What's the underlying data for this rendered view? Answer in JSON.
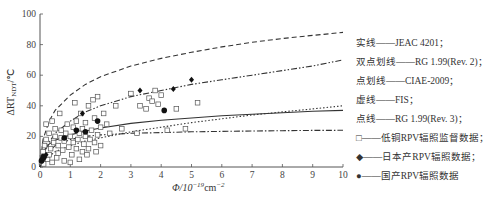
{
  "chart_data": {
    "type": "scatter",
    "title": "",
    "xlabel": "Φ/10⁻¹⁹cm⁻²",
    "ylabel": "ΔRT_NDT/℃",
    "xlim": [
      0,
      10
    ],
    "ylim": [
      0,
      100
    ],
    "x_ticks": [
      "0",
      "1",
      "2",
      "3",
      "4",
      "5",
      "6",
      "7",
      "8",
      "9",
      "10"
    ],
    "y_ticks": [
      "0",
      "20",
      "40",
      "60",
      "80",
      "100"
    ],
    "grid": false,
    "legend_position": "right",
    "curves": [
      {
        "name": "JEAC 4201",
        "style": "solid",
        "label": "实线——JEAC 4201；",
        "x": [
          0,
          0.1,
          0.3,
          0.5,
          1,
          1.5,
          2,
          3,
          4,
          5,
          6,
          7,
          8,
          9,
          10
        ],
        "y": [
          0,
          10,
          15,
          17.5,
          21,
          23.5,
          25.5,
          28.5,
          30.5,
          32,
          33.5,
          34.5,
          35.5,
          36.5,
          37
        ]
      },
      {
        "name": "RG 1.99(Rev. 2)",
        "style": "dash-dot-dot",
        "label": "双点划线——RG 1.99(Rev. 2)；",
        "x": [
          0,
          0.1,
          0.3,
          0.5,
          1,
          1.5,
          2,
          3,
          4,
          5,
          6,
          7,
          8,
          9,
          10
        ],
        "y": [
          0,
          8,
          16,
          22,
          30,
          36,
          40,
          46,
          50,
          54,
          57,
          60,
          63,
          66,
          70
        ]
      },
      {
        "name": "CIAE-2009",
        "style": "dash-dot",
        "label": "点划线——CIAE-2009；",
        "x": [
          0,
          0.1,
          0.3,
          0.5,
          1,
          1.5,
          2,
          3,
          4,
          5,
          6,
          7,
          8,
          9,
          10
        ],
        "y": [
          0,
          5,
          10,
          14,
          18,
          20,
          21,
          22,
          22.5,
          23,
          23.3,
          23.5,
          23.7,
          23.9,
          24
        ]
      },
      {
        "name": "FIS",
        "style": "dashed",
        "label": "虚线——FIS；",
        "x": [
          0,
          0.1,
          0.3,
          0.5,
          1,
          1.5,
          2,
          3,
          4,
          5,
          6,
          7,
          8,
          9,
          10
        ],
        "y": [
          0,
          18,
          30,
          37,
          47,
          54,
          59,
          66,
          71,
          75,
          78.5,
          81.5,
          84,
          86,
          88
        ]
      },
      {
        "name": "RG 1.99(Rev. 3)",
        "style": "dotted",
        "label": "点线——RG 1.99(Rev. 3)；",
        "x": [
          0,
          0.1,
          0.3,
          0.5,
          1,
          1.5,
          2,
          3,
          4,
          5,
          6,
          7,
          8,
          9,
          10
        ],
        "y": [
          0,
          3,
          7,
          10,
          14,
          17,
          19,
          23,
          26,
          29,
          31.5,
          34,
          36,
          38,
          40
        ]
      }
    ],
    "series": [
      {
        "name": "低铜RPV辐照监督数据",
        "marker": "open-square",
        "label": "□——低铜RPV辐照监督数据；",
        "points": [
          [
            0.05,
            3
          ],
          [
            0.08,
            6
          ],
          [
            0.1,
            10
          ],
          [
            0.12,
            2
          ],
          [
            0.15,
            14
          ],
          [
            0.2,
            18
          ],
          [
            0.2,
            28
          ],
          [
            0.25,
            5
          ],
          [
            0.3,
            8
          ],
          [
            0.3,
            22
          ],
          [
            0.35,
            12
          ],
          [
            0.4,
            30
          ],
          [
            0.4,
            3
          ],
          [
            0.45,
            16
          ],
          [
            0.5,
            20
          ],
          [
            0.5,
            25
          ],
          [
            0.55,
            6
          ],
          [
            0.6,
            9
          ],
          [
            0.6,
            14
          ],
          [
            0.65,
            35
          ],
          [
            0.7,
            19
          ],
          [
            0.7,
            24
          ],
          [
            0.75,
            11
          ],
          [
            0.8,
            17
          ],
          [
            0.8,
            4
          ],
          [
            0.85,
            22
          ],
          [
            0.9,
            28
          ],
          [
            0.95,
            13
          ],
          [
            1.0,
            20
          ],
          [
            1.0,
            3
          ],
          [
            1.05,
            8
          ],
          [
            1.1,
            16
          ],
          [
            1.1,
            26
          ],
          [
            1.15,
            42
          ],
          [
            1.2,
            30
          ],
          [
            1.2,
            12
          ],
          [
            1.25,
            18
          ],
          [
            1.3,
            5
          ],
          [
            1.3,
            22
          ],
          [
            1.35,
            35
          ],
          [
            1.4,
            10
          ],
          [
            1.4,
            25
          ],
          [
            1.45,
            15
          ],
          [
            1.5,
            20
          ],
          [
            1.5,
            29
          ],
          [
            1.55,
            8
          ],
          [
            1.6,
            40
          ],
          [
            1.6,
            12
          ],
          [
            1.65,
            18
          ],
          [
            1.7,
            24
          ],
          [
            1.75,
            44
          ],
          [
            1.8,
            32
          ],
          [
            1.8,
            16
          ],
          [
            1.85,
            10
          ],
          [
            1.9,
            21
          ],
          [
            1.9,
            46
          ],
          [
            2.0,
            26
          ],
          [
            2.0,
            14
          ],
          [
            2.1,
            35
          ],
          [
            2.2,
            28
          ],
          [
            2.3,
            22
          ],
          [
            2.5,
            40
          ],
          [
            2.7,
            25
          ],
          [
            3.0,
            48
          ],
          [
            3.2,
            22
          ],
          [
            3.3,
            40
          ],
          [
            3.5,
            38
          ],
          [
            3.6,
            45
          ],
          [
            3.7,
            43
          ],
          [
            3.8,
            50
          ],
          [
            3.9,
            41
          ],
          [
            4.0,
            47
          ],
          [
            4.2,
            24
          ],
          [
            4.5,
            38
          ],
          [
            4.8,
            25
          ],
          [
            5.2,
            42
          ]
        ]
      },
      {
        "name": "日本产RPV辐照数据",
        "marker": "filled-diamond",
        "label": "◆——日本产RPV辐照数据；",
        "points": [
          [
            0.05,
            5
          ],
          [
            0.1,
            7
          ],
          [
            0.15,
            6
          ],
          [
            0.2,
            8
          ],
          [
            1.4,
            35
          ],
          [
            3.3,
            50
          ],
          [
            4.4,
            51
          ],
          [
            5.0,
            57
          ]
        ]
      },
      {
        "name": "国产RPV辐照数据",
        "marker": "filled-circle",
        "label": "●——国产RPV辐照数据",
        "points": [
          [
            0.05,
            4
          ],
          [
            0.1,
            6
          ],
          [
            0.8,
            19
          ],
          [
            1.2,
            24
          ],
          [
            1.5,
            23
          ],
          [
            1.9,
            30
          ],
          [
            4.1,
            37
          ]
        ]
      }
    ]
  },
  "axes": {
    "ylabel_main": "ΔRT",
    "ylabel_sub": "NDT",
    "ylabel_unit": "/℃",
    "xlabel_main": "Φ/10",
    "xlabel_exp": "−19",
    "xlabel_unit": "cm",
    "xlabel_unit_exp": "−2"
  },
  "legend": {
    "items": [
      "实线——JEAC 4201；",
      "双点划线——RG 1.99(Rev. 2)；",
      "点划线——CIAE-2009；",
      "虚线——FIS；",
      "点线——RG 1.99(Rev. 3)；",
      "□——低铜RPV辐照监督数据；",
      "◆——日本产RPV辐照数据；",
      "●——国产RPV辐照数据"
    ]
  },
  "colors": {
    "line": "#333333",
    "axis": "#555555",
    "text": "#333333"
  }
}
